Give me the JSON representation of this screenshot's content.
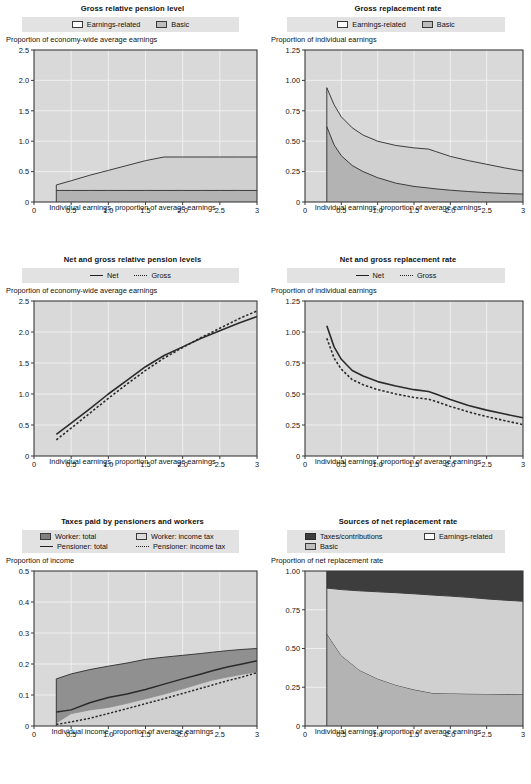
{
  "charts": [
    {
      "id": "gross-relative-pension-level",
      "title": "Gross relative pension level",
      "legend": [
        {
          "label": "Earnings-related",
          "swatch": "white"
        },
        {
          "label": "Basic",
          "swatch": "mid"
        }
      ],
      "ylabel": "Proportion of economy-wide average earnings",
      "xlabel": "Individual earnings, proportion of average earnings",
      "chart_data": {
        "type": "area",
        "title": "Gross relative pension level",
        "xlabel": "Individual earnings, proportion of average earnings",
        "ylabel": "Proportion of economy-wide average earnings",
        "xlim": [
          0,
          3
        ],
        "ylim": [
          0,
          2.5
        ],
        "xticks": [
          0,
          0.5,
          1.0,
          1.5,
          2.0,
          2.5,
          3
        ],
        "xticklabels": [
          "0",
          "0.5",
          "1.0",
          "1.5",
          "2.0",
          "2.5",
          "3"
        ],
        "yticks": [
          0,
          0.5,
          1.0,
          1.5,
          2.0,
          2.5
        ],
        "yticklabels": [
          "0",
          "0.5",
          "1.0",
          "1.5",
          "2.0",
          "2.5"
        ],
        "grid": true,
        "legend_position": "top",
        "x": [
          0.3,
          0.5,
          0.75,
          1.0,
          1.25,
          1.5,
          1.75,
          2.0,
          2.25,
          2.5,
          2.75,
          3.0
        ],
        "series": [
          {
            "name": "Basic",
            "stacked_base": true,
            "values": [
              0.19,
              0.19,
              0.19,
              0.19,
              0.19,
              0.19,
              0.19,
              0.19,
              0.19,
              0.19,
              0.19,
              0.19
            ]
          },
          {
            "name": "Earnings-related",
            "cumulative_top": true,
            "values": [
              0.28,
              0.35,
              0.44,
              0.52,
              0.6,
              0.68,
              0.74,
              0.74,
              0.74,
              0.74,
              0.74,
              0.74
            ]
          }
        ]
      }
    },
    {
      "id": "gross-replacement-rate",
      "title": "Gross replacement rate",
      "legend": [
        {
          "label": "Earnings-related",
          "swatch": "white"
        },
        {
          "label": "Basic",
          "swatch": "mid"
        }
      ],
      "ylabel": "Proportion of individual earnings",
      "xlabel": "Individual earnings, proportion of average earnings",
      "chart_data": {
        "type": "area",
        "title": "Gross replacement rate",
        "xlabel": "Individual earnings, proportion of average earnings",
        "ylabel": "Proportion of individual earnings",
        "xlim": [
          0,
          3
        ],
        "ylim": [
          0,
          1.25
        ],
        "xticks": [
          0,
          0.5,
          1.0,
          1.5,
          2.0,
          2.5,
          3
        ],
        "xticklabels": [
          "0",
          "0.5",
          "1.0",
          "1.5",
          "2.0",
          "2.5",
          "3"
        ],
        "yticks": [
          0,
          0.25,
          0.5,
          0.75,
          1.0,
          1.25
        ],
        "yticklabels": [
          "0",
          "0.25",
          "0.50",
          "0.75",
          "1.00",
          "1.25"
        ],
        "grid": true,
        "legend_position": "top",
        "x": [
          0.3,
          0.4,
          0.5,
          0.65,
          0.8,
          1.0,
          1.25,
          1.5,
          1.7,
          1.8,
          2.0,
          2.25,
          2.5,
          2.75,
          3.0
        ],
        "series": [
          {
            "name": "Basic",
            "stacked_base": true,
            "values": [
              0.62,
              0.47,
              0.38,
              0.3,
              0.25,
              0.2,
              0.155,
              0.128,
              0.115,
              0.108,
              0.097,
              0.086,
              0.077,
              0.07,
              0.065
            ]
          },
          {
            "name": "Earnings-related",
            "cumulative_top": true,
            "values": [
              0.94,
              0.8,
              0.7,
              0.61,
              0.55,
              0.5,
              0.465,
              0.445,
              0.435,
              0.415,
              0.375,
              0.34,
              0.31,
              0.28,
              0.255
            ]
          }
        ]
      }
    },
    {
      "id": "net-and-gross-relative-pension-levels",
      "title": "Net and gross relative pension levels",
      "legend": [
        {
          "label": "Net",
          "swatch": "line-solid"
        },
        {
          "label": "Gross",
          "swatch": "line-dotted"
        }
      ],
      "ylabel": "Proportion of economy-wide average earnings",
      "xlabel": "Individual earnings, proportion of average earnings",
      "chart_data": {
        "type": "line",
        "title": "Net and gross relative pension levels",
        "xlabel": "Individual earnings, proportion of average earnings",
        "ylabel": "Proportion of economy-wide average earnings",
        "xlim": [
          0,
          3
        ],
        "ylim": [
          0,
          2.5
        ],
        "xticks": [
          0,
          0.5,
          1.0,
          1.5,
          2.0,
          2.5,
          3
        ],
        "xticklabels": [
          "0",
          "0.5",
          "1.0",
          "1.5",
          "2.0",
          "2.5",
          "3"
        ],
        "yticks": [
          0,
          0.5,
          1.0,
          1.5,
          2.0,
          2.5
        ],
        "yticklabels": [
          "0",
          "0.5",
          "1.0",
          "1.5",
          "2.0",
          "2.5"
        ],
        "grid": true,
        "legend_position": "top",
        "x": [
          0.3,
          0.5,
          0.75,
          1.0,
          1.25,
          1.5,
          1.75,
          2.0,
          2.25,
          2.5,
          2.75,
          3.0
        ],
        "series": [
          {
            "name": "Net",
            "style": "solid",
            "values": [
              0.35,
              0.53,
              0.76,
              1.0,
              1.22,
              1.44,
              1.62,
              1.76,
              1.9,
              2.02,
              2.14,
              2.25
            ]
          },
          {
            "name": "Gross",
            "style": "dotted",
            "values": [
              0.26,
              0.45,
              0.69,
              0.93,
              1.16,
              1.38,
              1.58,
              1.75,
              1.91,
              2.06,
              2.21,
              2.34
            ]
          }
        ]
      }
    },
    {
      "id": "net-and-gross-replacement-rate",
      "title": "Net and gross replacement rate",
      "legend": [
        {
          "label": "Net",
          "swatch": "line-solid"
        },
        {
          "label": "Gross",
          "swatch": "line-dotted"
        }
      ],
      "ylabel": "Proportion of individual earnings",
      "xlabel": "Individual earnings, proportion of average earnings",
      "chart_data": {
        "type": "line",
        "title": "Net and gross replacement rate",
        "xlabel": "Individual earnings, proportion of average earnings",
        "ylabel": "Proportion of individual earnings",
        "xlim": [
          0,
          3
        ],
        "ylim": [
          0,
          1.25
        ],
        "xticks": [
          0,
          0.5,
          1.0,
          1.5,
          2.0,
          2.5,
          3
        ],
        "xticklabels": [
          "0",
          "0.5",
          "1.0",
          "1.5",
          "2.0",
          "2.5",
          "3"
        ],
        "yticks": [
          0,
          0.25,
          0.5,
          0.75,
          1.0,
          1.25
        ],
        "yticklabels": [
          "0",
          "0.25",
          "0.50",
          "0.75",
          "1.00",
          "1.25"
        ],
        "grid": true,
        "legend_position": "top",
        "x": [
          0.3,
          0.4,
          0.5,
          0.65,
          0.8,
          1.0,
          1.25,
          1.5,
          1.7,
          1.8,
          2.0,
          2.25,
          2.5,
          2.75,
          3.0
        ],
        "series": [
          {
            "name": "Net",
            "style": "solid",
            "values": [
              1.05,
              0.88,
              0.78,
              0.69,
              0.645,
              0.6,
              0.565,
              0.535,
              0.52,
              0.5,
              0.455,
              0.408,
              0.37,
              0.338,
              0.308
            ]
          },
          {
            "name": "Gross",
            "style": "dotted",
            "values": [
              0.95,
              0.79,
              0.7,
              0.615,
              0.575,
              0.535,
              0.5,
              0.472,
              0.458,
              0.44,
              0.4,
              0.355,
              0.318,
              0.285,
              0.253
            ]
          }
        ]
      }
    },
    {
      "id": "taxes-paid-by-pensioners-and-workers",
      "title": "Taxes paid by pensioners and workers",
      "legend": [
        {
          "label": "Worker: total",
          "swatch": "dark"
        },
        {
          "label": "Worker: income tax",
          "swatch": "light"
        },
        {
          "label": "Pensioner: total",
          "swatch": "line-solid"
        },
        {
          "label": "Pensioner: income tax",
          "swatch": "line-dotted"
        }
      ],
      "ylabel": "Proportion of income",
      "xlabel": "Individual income, proportion of average earnings",
      "chart_data": {
        "type": "area",
        "title": "Taxes paid by pensioners and workers",
        "xlabel": "Individual income, proportion of average earnings",
        "ylabel": "Proportion of income",
        "xlim": [
          0,
          3
        ],
        "ylim": [
          0,
          0.5
        ],
        "xticks": [
          0,
          0.5,
          1.0,
          1.5,
          2.0,
          2.5,
          3
        ],
        "xticklabels": [
          "0",
          "0.5",
          "1.0",
          "1.5",
          "2.0",
          "2.5",
          "3"
        ],
        "yticks": [
          0,
          0.1,
          0.2,
          0.3,
          0.4,
          0.5
        ],
        "yticklabels": [
          "0",
          "0.1",
          "0.2",
          "0.3",
          "0.4",
          "0.5"
        ],
        "grid": true,
        "legend_position": "top",
        "x": [
          0.3,
          0.5,
          0.75,
          1.0,
          1.25,
          1.5,
          1.75,
          2.0,
          2.25,
          2.4,
          2.6,
          2.8,
          3.0
        ],
        "series": [
          {
            "name": "Worker: total",
            "style": "area-dark",
            "values": [
              0.152,
              0.168,
              0.182,
              0.193,
              0.203,
              0.215,
              0.222,
              0.228,
              0.234,
              0.238,
              0.243,
              0.247,
              0.25
            ]
          },
          {
            "name": "Worker: income tax",
            "style": "area-light",
            "values": [
              0.01,
              0.04,
              0.052,
              0.06,
              0.073,
              0.088,
              0.103,
              0.12,
              0.138,
              0.148,
              0.158,
              0.167,
              0.175
            ]
          },
          {
            "name": "Pensioner: total",
            "style": "solid",
            "values": [
              0.045,
              0.052,
              0.075,
              0.092,
              0.103,
              0.118,
              0.135,
              0.152,
              0.168,
              0.178,
              0.19,
              0.2,
              0.21
            ]
          },
          {
            "name": "Pensioner: income tax",
            "style": "dotted",
            "values": [
              0.005,
              0.013,
              0.025,
              0.04,
              0.056,
              0.072,
              0.088,
              0.105,
              0.122,
              0.132,
              0.146,
              0.158,
              0.172
            ]
          }
        ]
      }
    },
    {
      "id": "sources-of-net-replacement-rate",
      "title": "Sources of net replacement rate",
      "legend": [
        {
          "label": "Taxes/contributions",
          "swatch": "vdark"
        },
        {
          "label": "Earnings-related",
          "swatch": "white"
        },
        {
          "label": "Basic",
          "swatch": "mid"
        }
      ],
      "ylabel": "Proportion of net replacement rate",
      "xlabel": "Individual earnings, proportion of average earnings",
      "chart_data": {
        "type": "area",
        "title": "Sources of net replacement rate",
        "xlabel": "Individual earnings, proportion of average earnings",
        "ylabel": "Proportion of net replacement rate",
        "xlim": [
          0,
          3
        ],
        "ylim": [
          0,
          1.0
        ],
        "xticks": [
          0,
          0.5,
          1.0,
          1.5,
          2.0,
          2.5,
          3
        ],
        "xticklabels": [
          "0",
          "0.5",
          "1.0",
          "1.5",
          "2.0",
          "2.5",
          "3"
        ],
        "yticks": [
          0,
          0.25,
          0.5,
          0.75,
          1.0
        ],
        "yticklabels": [
          "0",
          "0.25",
          "0.50",
          "0.75",
          "1.00"
        ],
        "grid": true,
        "legend_position": "top",
        "stacked": true,
        "x": [
          0.3,
          0.5,
          0.75,
          1.0,
          1.25,
          1.5,
          1.75,
          2.0,
          2.25,
          2.5,
          2.75,
          3.0
        ],
        "series": [
          {
            "name": "Basic",
            "boundary_top": [
              0.595,
              0.455,
              0.36,
              0.305,
              0.265,
              0.235,
              0.213,
              0.21,
              0.208,
              0.207,
              0.206,
              0.205
            ]
          },
          {
            "name": "Earnings-related",
            "boundary_top": [
              0.89,
              0.88,
              0.872,
              0.866,
              0.86,
              0.853,
              0.845,
              0.838,
              0.83,
              0.82,
              0.812,
              0.805
            ]
          },
          {
            "name": "Taxes/contributions",
            "boundary_top": [
              1.0,
              1.0,
              1.0,
              1.0,
              1.0,
              1.0,
              1.0,
              1.0,
              1.0,
              1.0,
              1.0,
              1.0
            ]
          }
        ]
      }
    }
  ]
}
